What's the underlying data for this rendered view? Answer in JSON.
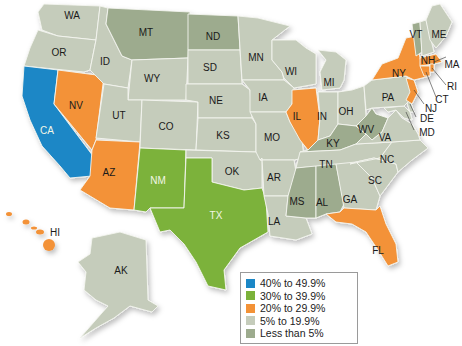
{
  "colors": {
    "cat_40_49": "#1b87c6",
    "cat_30_39": "#7bb23a",
    "cat_20_29": "#f39237",
    "cat_5_19": "#c5ccbb",
    "cat_lt5": "#9dab8e"
  },
  "legend": {
    "items": [
      {
        "label": "40% to 49.9%",
        "color": "#1b87c6"
      },
      {
        "label": "30% to 39.9%",
        "color": "#7bb23a"
      },
      {
        "label": "20% to 29.9%",
        "color": "#f39237"
      },
      {
        "label": "5% to 19.9%",
        "color": "#c5ccbb"
      },
      {
        "label": "Less than 5%",
        "color": "#9dab8e"
      }
    ]
  },
  "states": {
    "WA": {
      "label": "WA",
      "category": "5% to 19.9%"
    },
    "OR": {
      "label": "OR",
      "category": "5% to 19.9%"
    },
    "CA": {
      "label": "CA",
      "category": "40% to 49.9%"
    },
    "NV": {
      "label": "NV",
      "category": "20% to 29.9%"
    },
    "ID": {
      "label": "ID",
      "category": "5% to 19.9%"
    },
    "MT": {
      "label": "MT",
      "category": "Less than 5%"
    },
    "WY": {
      "label": "WY",
      "category": "5% to 19.9%"
    },
    "UT": {
      "label": "UT",
      "category": "5% to 19.9%"
    },
    "AZ": {
      "label": "AZ",
      "category": "20% to 29.9%"
    },
    "CO": {
      "label": "CO",
      "category": "5% to 19.9%"
    },
    "NM": {
      "label": "NM",
      "category": "30% to 39.9%"
    },
    "ND": {
      "label": "ND",
      "category": "Less than 5%"
    },
    "SD": {
      "label": "SD",
      "category": "5% to 19.9%"
    },
    "NE": {
      "label": "NE",
      "category": "5% to 19.9%"
    },
    "KS": {
      "label": "KS",
      "category": "5% to 19.9%"
    },
    "OK": {
      "label": "OK",
      "category": "5% to 19.9%"
    },
    "TX": {
      "label": "TX",
      "category": "30% to 39.9%"
    },
    "MN": {
      "label": "MN",
      "category": "5% to 19.9%"
    },
    "IA": {
      "label": "IA",
      "category": "5% to 19.9%"
    },
    "MO": {
      "label": "MO",
      "category": "5% to 19.9%"
    },
    "AR": {
      "label": "AR",
      "category": "5% to 19.9%"
    },
    "LA": {
      "label": "LA",
      "category": "5% to 19.9%"
    },
    "WI": {
      "label": "WI",
      "category": "5% to 19.9%"
    },
    "IL": {
      "label": "IL",
      "category": "20% to 29.9%"
    },
    "MI": {
      "label": "MI",
      "category": "5% to 19.9%"
    },
    "IN": {
      "label": "IN",
      "category": "5% to 19.9%"
    },
    "OH": {
      "label": "OH",
      "category": "5% to 19.9%"
    },
    "KY": {
      "label": "KY",
      "category": "Less than 5%"
    },
    "TN": {
      "label": "TN",
      "category": "5% to 19.9%"
    },
    "MS": {
      "label": "MS",
      "category": "Less than 5%"
    },
    "AL": {
      "label": "AL",
      "category": "Less than 5%"
    },
    "GA": {
      "label": "GA",
      "category": "5% to 19.9%"
    },
    "FL": {
      "label": "FL",
      "category": "20% to 29.9%"
    },
    "SC": {
      "label": "SC",
      "category": "5% to 19.9%"
    },
    "NC": {
      "label": "NC",
      "category": "5% to 19.9%"
    },
    "VA": {
      "label": "VA",
      "category": "5% to 19.9%"
    },
    "WV": {
      "label": "WV",
      "category": "Less than 5%"
    },
    "PA": {
      "label": "PA",
      "category": "5% to 19.9%"
    },
    "NY": {
      "label": "NY",
      "category": "20% to 29.9%"
    },
    "VT": {
      "label": "VT",
      "category": "Less than 5%"
    },
    "NH": {
      "label": "NH",
      "category": "5% to 19.9%"
    },
    "ME": {
      "label": "ME",
      "category": "5% to 19.9%"
    },
    "MA": {
      "label": "MA",
      "category": "20% to 29.9%"
    },
    "RI": {
      "label": "RI",
      "category": "20% to 29.9%"
    },
    "CT": {
      "label": "CT",
      "category": "20% to 29.9%"
    },
    "NJ": {
      "label": "NJ",
      "category": "20% to 29.9%"
    },
    "DE": {
      "label": "DE",
      "category": "5% to 19.9%"
    },
    "MD": {
      "label": "MD",
      "category": "5% to 19.9%"
    },
    "HI": {
      "label": "HI",
      "category": "20% to 29.9%"
    },
    "AK": {
      "label": "AK",
      "category": "5% to 19.9%"
    }
  }
}
